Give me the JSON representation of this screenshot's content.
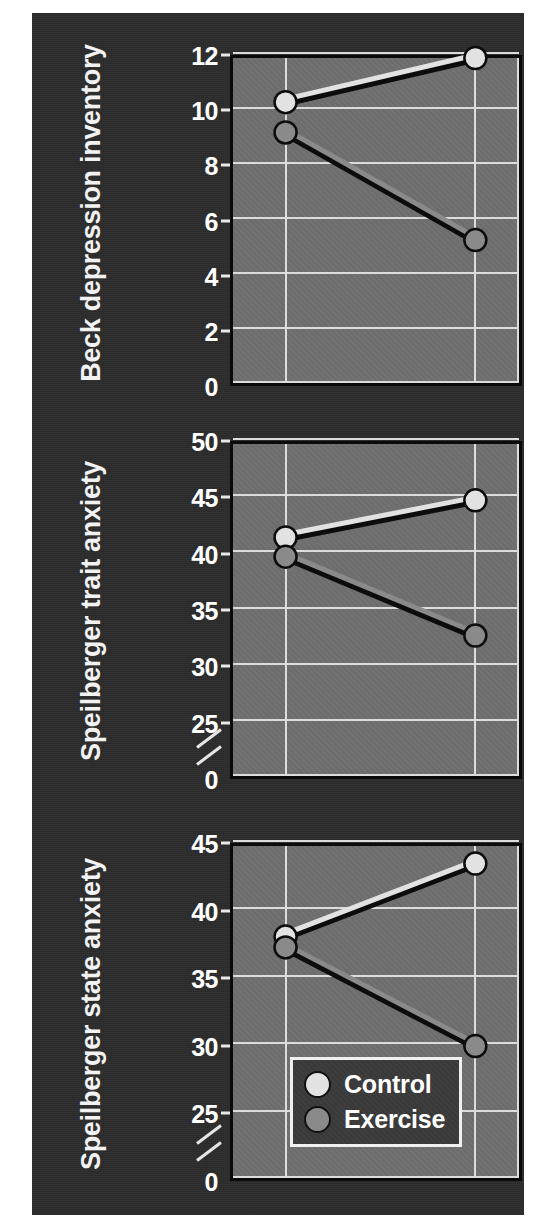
{
  "figure": {
    "background_color": "#2b2b2b",
    "plot_background_color": "#6f6f6f",
    "grid_color": "#dcdcdc",
    "axis_color": "#0a0a0a"
  },
  "legend": {
    "position": "bottom-center-of-third-panel",
    "entries": [
      {
        "label": "Control",
        "color": "#e2e2e2",
        "marker": "circle"
      },
      {
        "label": "Exercise",
        "color": "#8a8a8a",
        "marker": "circle"
      }
    ]
  },
  "chart_data": [
    {
      "type": "line",
      "panel": 1,
      "ylabel": "Beck depression inventory",
      "xlabel": "",
      "x": [
        "Pre",
        "Post"
      ],
      "ylim": [
        0,
        12
      ],
      "yticks": [
        0,
        2,
        4,
        6,
        8,
        10,
        12
      ],
      "ytick_labels": [
        "0",
        "2",
        "4",
        "6",
        "8",
        "10",
        "12"
      ],
      "axis_break": false,
      "grid": true,
      "series": [
        {
          "name": "Control",
          "values": [
            10.4,
            12.0
          ],
          "color": "#e2e2e2"
        },
        {
          "name": "Exercise",
          "values": [
            9.3,
            5.4
          ],
          "color": "#8a8a8a"
        }
      ]
    },
    {
      "type": "line",
      "panel": 2,
      "ylabel": "Speilberger trait anxiety",
      "xlabel": "",
      "x": [
        "Pre",
        "Post"
      ],
      "ylim": [
        25,
        50
      ],
      "yticks": [
        0,
        25,
        30,
        35,
        40,
        45,
        50
      ],
      "ytick_labels": [
        "0",
        "25",
        "30",
        "35",
        "40",
        "45",
        "50"
      ],
      "axis_break": true,
      "axis_break_between": [
        0,
        25
      ],
      "grid": true,
      "series": [
        {
          "name": "Control",
          "values": [
            41.7,
            45.0
          ],
          "color": "#e2e2e2"
        },
        {
          "name": "Exercise",
          "values": [
            40.0,
            33.0
          ],
          "color": "#8a8a8a"
        }
      ]
    },
    {
      "type": "line",
      "panel": 3,
      "ylabel": "Speilberger state anxiety",
      "xlabel": "",
      "x": [
        "Pre",
        "Post"
      ],
      "ylim": [
        25,
        45
      ],
      "yticks": [
        0,
        25,
        30,
        35,
        40,
        45
      ],
      "ytick_labels": [
        "0",
        "25",
        "30",
        "35",
        "40",
        "45"
      ],
      "axis_break": true,
      "axis_break_between": [
        0,
        25
      ],
      "grid": true,
      "series": [
        {
          "name": "Control",
          "values": [
            38.3,
            43.7
          ],
          "color": "#e2e2e2"
        },
        {
          "name": "Exercise",
          "values": [
            37.5,
            30.2
          ],
          "color": "#8a8a8a"
        }
      ]
    }
  ]
}
